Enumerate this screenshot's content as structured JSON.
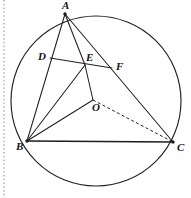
{
  "figure": {
    "width": 191,
    "height": 198,
    "background_color": "#ffffff",
    "line_color": "#20201e",
    "dashed_color": "#262522",
    "margin_guide_color": "#8e8e8e"
  },
  "circle": {
    "name": "circumcircle",
    "center_x": 96,
    "center_y": 101,
    "radius": 85,
    "stroke_color": "#23221f",
    "stroke_width": 1.15
  },
  "points": [
    {
      "id": "A",
      "label": "A",
      "x": 65,
      "y": 14,
      "label_x": 62,
      "label_y": 9,
      "has_dot": true,
      "on": "circle"
    },
    {
      "id": "B",
      "label": "B",
      "x": 27,
      "y": 141,
      "label_x": 16,
      "label_y": 150,
      "has_dot": true,
      "on": "circle"
    },
    {
      "id": "C",
      "label": "C",
      "x": 173,
      "y": 142,
      "label_x": 177,
      "label_y": 151,
      "has_dot": true,
      "on": "circle"
    },
    {
      "id": "D",
      "label": "D",
      "x": 50,
      "y": 58,
      "label_x": 38,
      "label_y": 60,
      "has_dot": false,
      "on": "segment-AB"
    },
    {
      "id": "E",
      "label": "E",
      "x": 85,
      "y": 65,
      "label_x": 86,
      "label_y": 61,
      "has_dot": false,
      "on": "intersection"
    },
    {
      "id": "F",
      "label": "F",
      "x": 112,
      "y": 68,
      "label_x": 116,
      "label_y": 70,
      "has_dot": false,
      "on": "segment-AC"
    },
    {
      "id": "O",
      "label": "O",
      "x": 93,
      "y": 100,
      "label_x": 92,
      "label_y": 111,
      "has_dot": false,
      "on": "center"
    }
  ],
  "segments": [
    {
      "id": "AB",
      "from": "A",
      "to": "B",
      "style": "solid",
      "weight": "normal"
    },
    {
      "id": "AC",
      "from": "A",
      "to": "C",
      "style": "solid",
      "weight": "normal"
    },
    {
      "id": "BC",
      "from": "B",
      "to": "C",
      "style": "solid",
      "weight": "thick"
    },
    {
      "id": "AE",
      "from": "A",
      "to": "E",
      "style": "solid",
      "weight": "normal"
    },
    {
      "id": "DF",
      "from": "D",
      "to": "F",
      "style": "solid",
      "weight": "normal"
    },
    {
      "id": "BE",
      "from": "B",
      "to": "E",
      "style": "solid",
      "weight": "normal"
    },
    {
      "id": "EO",
      "from": "E",
      "to": "O",
      "style": "solid",
      "weight": "normal"
    },
    {
      "id": "BO",
      "from": "B",
      "to": "O",
      "style": "solid",
      "weight": "normal"
    },
    {
      "id": "OC",
      "from": "O",
      "to": "C",
      "style": "dashed",
      "weight": "normal"
    }
  ],
  "margin_guide": {
    "name": "page-margin-dotted-line",
    "x": 4,
    "y_start": 0,
    "y_end": 198
  }
}
